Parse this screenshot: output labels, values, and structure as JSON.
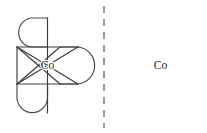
{
  "figure": {
    "background_color": "#ffffff",
    "stroke_color": "#3c3c3c",
    "chelate_stroke_color": "#4a4a4a",
    "label_color": "#1a1a1a",
    "mirror_line": {
      "name": "mirror-plane",
      "style": "dashed",
      "orientation": "vertical",
      "x": 104,
      "y_top": 6,
      "y_bottom": 128,
      "color": "#6e6e6e",
      "dash_pattern": "7 6",
      "width": 1.4
    },
    "structures": [
      {
        "id": "left",
        "name": "delta-isomer",
        "metal_label": "Co",
        "metal_center": {
          "x": 47.5,
          "y": 65.5
        },
        "chelate_count": 3,
        "octahedron_vertices": [
          {
            "name": "vertex-top",
            "x": 47.5,
            "y": 18.0
          },
          {
            "name": "vertex-bottom",
            "x": 47.5,
            "y": 113.0
          },
          {
            "name": "vertex-upper-left",
            "x": 17.0,
            "y": 47.0
          },
          {
            "name": "vertex-upper-right",
            "x": 78.0,
            "y": 47.0
          },
          {
            "name": "vertex-lower-left",
            "x": 17.0,
            "y": 84.0
          },
          {
            "name": "vertex-lower-right",
            "x": 78.0,
            "y": 84.0
          }
        ],
        "chelate_rings": [
          {
            "name": "chelate-ring-top",
            "orientation": "vertical-up"
          },
          {
            "name": "chelate-ring-right",
            "orientation": "horizontal-right"
          },
          {
            "name": "chelate-ring-bottom-left",
            "orientation": "vertical-down"
          }
        ]
      },
      {
        "id": "right",
        "name": "lambda-isomer",
        "metal_label": "Co",
        "metal_center": {
          "x": 160.5,
          "y": 65.5
        },
        "chelate_count": 3,
        "octahedron_vertices": [
          {
            "name": "vertex-top",
            "x": 160.5,
            "y": 18.0
          },
          {
            "name": "vertex-bottom",
            "x": 160.5,
            "y": 113.0
          },
          {
            "name": "vertex-upper-left",
            "x": 130.0,
            "y": 47.0
          },
          {
            "name": "vertex-upper-right",
            "x": 191.0,
            "y": 47.0
          },
          {
            "name": "vertex-lower-left",
            "x": 130.0,
            "y": 84.0
          },
          {
            "name": "vertex-lower-right",
            "x": 191.0,
            "y": 84.0
          }
        ],
        "chelate_rings": [
          {
            "name": "chelate-ring-top",
            "orientation": "vertical-up"
          },
          {
            "name": "chelate-ring-left",
            "orientation": "horizontal-left"
          },
          {
            "name": "chelate-ring-bottom-right",
            "orientation": "vertical-down"
          }
        ]
      }
    ]
  }
}
